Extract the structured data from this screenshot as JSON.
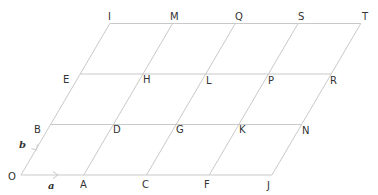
{
  "diagram": {
    "type": "parallelogram-grid",
    "columns": 4,
    "rows": 3,
    "colors": {
      "line": "#c9c9c9",
      "text": "#333333",
      "background": "#ffffff"
    },
    "vectors": [
      {
        "name": "a",
        "label": "a",
        "from": "O",
        "to": "A",
        "direction": "horizontal"
      },
      {
        "name": "b",
        "label": "b",
        "from": "O",
        "to": "B",
        "direction": "slanted"
      }
    ],
    "points": [
      {
        "label": "O",
        "i": 0,
        "j": 0
      },
      {
        "label": "A",
        "i": 1,
        "j": 0
      },
      {
        "label": "C",
        "i": 2,
        "j": 0
      },
      {
        "label": "F",
        "i": 3,
        "j": 0
      },
      {
        "label": "J",
        "i": 4,
        "j": 0
      },
      {
        "label": "B",
        "i": 0,
        "j": 1
      },
      {
        "label": "D",
        "i": 1,
        "j": 1
      },
      {
        "label": "G",
        "i": 2,
        "j": 1
      },
      {
        "label": "K",
        "i": 3,
        "j": 1
      },
      {
        "label": "N",
        "i": 4,
        "j": 1
      },
      {
        "label": "E",
        "i": 0,
        "j": 2
      },
      {
        "label": "H",
        "i": 1,
        "j": 2
      },
      {
        "label": "L",
        "i": 2,
        "j": 2
      },
      {
        "label": "P",
        "i": 3,
        "j": 2
      },
      {
        "label": "R",
        "i": 4,
        "j": 2
      },
      {
        "label": "I",
        "i": 0,
        "j": 3
      },
      {
        "label": "M",
        "i": 1,
        "j": 3
      },
      {
        "label": "Q",
        "i": 2,
        "j": 3
      },
      {
        "label": "S",
        "i": 3,
        "j": 3
      },
      {
        "label": "T",
        "i": 4,
        "j": 3
      }
    ]
  }
}
